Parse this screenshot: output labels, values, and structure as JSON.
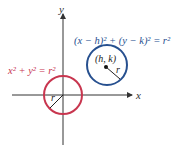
{
  "diagram": {
    "axes": {
      "x_label": "x",
      "y_label": "y"
    },
    "origin_circle": {
      "equation": "x² + y² = r²",
      "radius_label": "r",
      "color": "#c8364f"
    },
    "shifted_circle": {
      "equation": "(x − h)² + (y − k)² = r²",
      "center_label": "(h, k)",
      "radius_label": "r",
      "color": "#27508f"
    },
    "axis_color": "#333333"
  }
}
